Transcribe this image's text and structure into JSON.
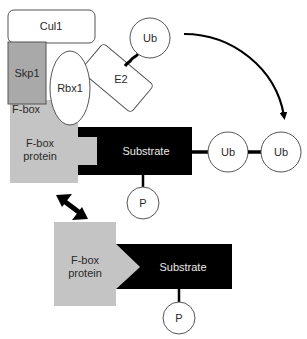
{
  "diagram": {
    "type": "SCF ubiquitin ligase complex schematic",
    "colors": {
      "background": "#ffffff",
      "outline": "#555555",
      "skp1_fill": "#a9a9a9",
      "fbox_fill": "#c4c4c4",
      "substrate_fill": "#000000",
      "node_fill": "#ffffff"
    },
    "complex": {
      "cul1": {
        "label": "Cul1"
      },
      "skp1": {
        "label": "Skp1"
      },
      "rbx1": {
        "label": "Rbx1"
      },
      "e2": {
        "label": "E2"
      },
      "e2_ub": {
        "label": "Ub"
      },
      "fbox_domain": {
        "label": "F-box"
      },
      "fbox_protein": {
        "label_line1": "F-box",
        "label_line2": "protein"
      },
      "substrate": {
        "label": "Substrate"
      },
      "phospho": {
        "label": "P"
      },
      "ub_chain": [
        {
          "label": "Ub"
        },
        {
          "label": "Ub"
        }
      ]
    },
    "free_state": {
      "fbox_protein": {
        "label_line1": "F-box",
        "label_line2": "protein"
      },
      "substrate": {
        "label": "Substrate"
      },
      "phospho": {
        "label": "P"
      }
    },
    "arrows": [
      {
        "name": "ub-transfer-arrow",
        "from": "E2-bound Ub",
        "to": "substrate Ub chain",
        "style": "curved"
      },
      {
        "name": "binding-equilibrium-arrow",
        "from": "bound complex",
        "to": "free F-box protein/substrate",
        "style": "double-headed"
      }
    ]
  }
}
